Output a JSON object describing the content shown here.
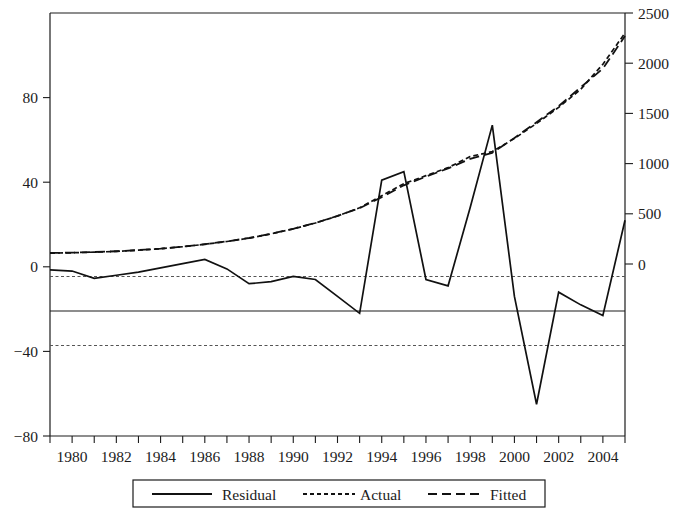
{
  "chart_data": {
    "type": "line",
    "title": "",
    "subtitle": "",
    "xlabel": "",
    "ylabel": "",
    "grid": false,
    "legend_position": "bottom",
    "x": [
      1979,
      1980,
      1981,
      1982,
      1983,
      1984,
      1985,
      1986,
      1987,
      1988,
      1989,
      1990,
      1991,
      1992,
      1993,
      1994,
      1995,
      1996,
      1997,
      1998,
      1999,
      2000,
      2001,
      2002,
      2003,
      2004,
      2005
    ],
    "xlim": [
      1979,
      2005
    ],
    "xticks": [
      1979,
      1980,
      1981,
      1982,
      1983,
      1984,
      1985,
      1986,
      1987,
      1988,
      1989,
      1990,
      1991,
      1992,
      1993,
      1994,
      1995,
      1996,
      1997,
      1998,
      1999,
      2000,
      2001,
      2002,
      2003,
      2004,
      2005
    ],
    "xtick_labels": [
      "1980",
      "1982",
      "1984",
      "1986",
      "1988",
      "1990",
      "1992",
      "1994",
      "1996",
      "1998",
      "2000",
      "2002",
      "2004"
    ],
    "xtick_label_values": [
      1980,
      1982,
      1984,
      1986,
      1988,
      1990,
      1992,
      1994,
      1996,
      1998,
      2000,
      2002,
      2004
    ],
    "left_axis": {
      "name": "Residual",
      "ylim": [
        -80,
        120
      ],
      "ticks": [
        -80,
        -40,
        0,
        40,
        80
      ],
      "tick_labels": [
        "−80",
        "−40",
        "0",
        "40",
        "80"
      ]
    },
    "right_axis": {
      "name": "Actual / Fitted",
      "ylim": [
        0,
        2500
      ],
      "ticks": [
        0,
        500,
        1000,
        1500,
        2000,
        2500
      ],
      "tick_labels": [
        "0",
        "500",
        "1000",
        "1500",
        "2000",
        "2500"
      ]
    },
    "reference_lines": {
      "zero": 0,
      "upper_band": 22,
      "lower_band": -22
    },
    "series": [
      {
        "name": "Residual",
        "axis": "left",
        "style": "solid",
        "values": [
          -1.5,
          -2.0,
          -5.5,
          -4.0,
          -2.5,
          -0.5,
          1.5,
          3.5,
          -1.0,
          -8.0,
          -7.0,
          -4.5,
          -6.0,
          -14.0,
          -22.0,
          41.0,
          45.0,
          -6.0,
          -9.0,
          28.0,
          67.0,
          -14.0,
          -65.0,
          -12.0,
          -18.0,
          -23.0,
          22.0
        ]
      },
      {
        "name": "Actual",
        "axis": "right",
        "style": "fine-dash",
        "values": [
          108,
          112,
          118,
          126,
          138,
          152,
          172,
          196,
          224,
          258,
          300,
          350,
          408,
          478,
          560,
          680,
          800,
          880,
          960,
          1070,
          1120,
          1250,
          1400,
          1560,
          1740,
          1990,
          2300
        ]
      },
      {
        "name": "Fitted",
        "axis": "right",
        "style": "long-dash",
        "values": [
          110,
          113,
          119,
          127,
          139,
          153,
          173,
          197,
          225,
          259,
          301,
          351,
          409,
          479,
          556,
          666,
          784,
          870,
          952,
          1048,
          1108,
          1256,
          1412,
          1572,
          1760,
          1946,
          2270
        ]
      }
    ],
    "legend": [
      {
        "label": "Residual",
        "style": "solid"
      },
      {
        "label": "Actual",
        "style": "fine-dash"
      },
      {
        "label": "Fitted",
        "style": "long-dash"
      }
    ]
  }
}
